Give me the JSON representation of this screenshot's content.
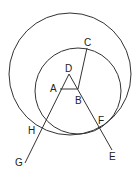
{
  "diagram": {
    "title": "",
    "points": {
      "A": {
        "label": "A",
        "x": 60,
        "y": 89,
        "lx": 50,
        "ly": 92
      },
      "B": {
        "label": "B",
        "x": 78,
        "y": 89,
        "lx": 75,
        "ly": 104
      },
      "C": {
        "label": "C",
        "x": 87,
        "y": 48,
        "lx": 84,
        "ly": 46
      },
      "D": {
        "label": "D",
        "x": 69,
        "y": 74,
        "lx": 65,
        "ly": 72
      },
      "E": {
        "label": "E",
        "x": 112,
        "y": 150,
        "lx": 109,
        "ly": 160
      },
      "F": {
        "label": "F",
        "x": 102,
        "y": 127,
        "lx": 98,
        "ly": 124
      },
      "G": {
        "label": "G",
        "x": 25,
        "y": 163,
        "lx": 15,
        "ly": 166
      },
      "H": {
        "label": "H",
        "x": 42,
        "y": 128,
        "lx": 28,
        "ly": 134
      }
    },
    "circles": [
      {
        "name": "large-circle",
        "cx": 70,
        "cy": 74,
        "r": 61
      },
      {
        "name": "small-circle",
        "cx": 78,
        "cy": 91,
        "r": 43
      }
    ],
    "segments": [
      {
        "name": "segment-AB",
        "from": "A",
        "to": "B"
      },
      {
        "name": "segment-BC",
        "from": "B",
        "to": "C"
      },
      {
        "name": "line-DG",
        "from": "D",
        "to": "G"
      },
      {
        "name": "line-DE",
        "from": "D",
        "to": "E"
      }
    ]
  }
}
